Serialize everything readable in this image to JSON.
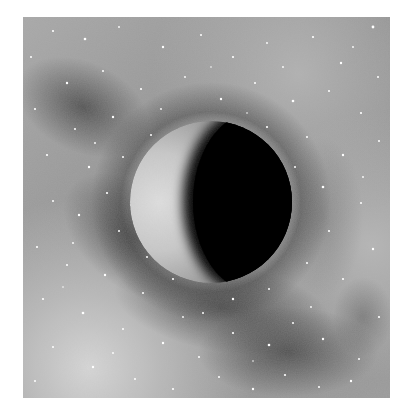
{
  "image": {
    "subject": "crescent planet in starfield",
    "style": "grayscale illustration",
    "frame": {
      "x": 23,
      "y": 17,
      "width": 367,
      "height": 381
    },
    "colors": {
      "page_background": "#ffffff",
      "sky_light": "#c9c9c9",
      "sky_mid": "#9c9c9c",
      "sky_dark": "#4a4a4a",
      "planet_lit": "#d4d4d4",
      "planet_shadow": "#000000",
      "star": "#ffffff"
    },
    "planet": {
      "cx": 188,
      "cy": 185,
      "r": 81,
      "lit_side": "left",
      "phase": "crescent"
    }
  }
}
